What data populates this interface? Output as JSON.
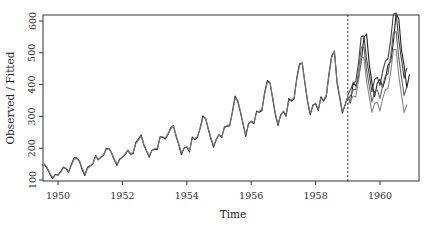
{
  "chart_data": {
    "type": "line",
    "title": "",
    "xlabel": "Time",
    "ylabel": "Observed / Fitted",
    "xlim": [
      1949.53,
      1961.2
    ],
    "ylim": [
      90,
      625
    ],
    "x_ticks": [
      1950,
      1952,
      1954,
      1956,
      1958,
      1960
    ],
    "x_tick_labels": [
      "1950",
      "1952",
      "1954",
      "1956",
      "1958",
      "1960"
    ],
    "y_ticks": [
      100,
      200,
      300,
      400,
      500,
      600
    ],
    "y_tick_labels": [
      "100",
      "200",
      "300",
      "400",
      "500",
      "600"
    ],
    "grid": false,
    "legend": null,
    "vline": {
      "x": 1959.0,
      "style": "dotted"
    },
    "series": [
      {
        "name": "Observed",
        "color": "#222222",
        "start": 1949.5,
        "step": 0.08333,
        "values": [
          148,
          148,
          136,
          119,
          104,
          118,
          115,
          126,
          141,
          135,
          125,
          149,
          170,
          170,
          158,
          133,
          114,
          140,
          145,
          150,
          178,
          163,
          172,
          178,
          199,
          199,
          184,
          162,
          146,
          166,
          171,
          180,
          193,
          181,
          183,
          218,
          230,
          242,
          209,
          191,
          172,
          194,
          196,
          196,
          236,
          235,
          229,
          243,
          264,
          272,
          237,
          211,
          180,
          201,
          204,
          188,
          235,
          227,
          234,
          264,
          302,
          293,
          259,
          229,
          203,
          229,
          242,
          233,
          267,
          269,
          270,
          315,
          364,
          347,
          312,
          274,
          237,
          278,
          284,
          277,
          317,
          313,
          318,
          374,
          413,
          405,
          355,
          306,
          271,
          306,
          315,
          301,
          356,
          348,
          355,
          422,
          465,
          467,
          404,
          347,
          305,
          336,
          340,
          318,
          362,
          348,
          363,
          435,
          491,
          505,
          404,
          359,
          310,
          337,
          360,
          342,
          406,
          396,
          420,
          472,
          548,
          559,
          463,
          407,
          362,
          405,
          417,
          391,
          419,
          461,
          472,
          535,
          622,
          606,
          508,
          461,
          390,
          432
        ]
      },
      {
        "name": "Fitted",
        "color": "#777777",
        "start": 1949.5,
        "step": 0.08333,
        "values": [
          148,
          150,
          138,
          122,
          108,
          116,
          117,
          124,
          139,
          137,
          128,
          146,
          165,
          168,
          160,
          138,
          118,
          136,
          144,
          152,
          174,
          166,
          170,
          180,
          196,
          198,
          186,
          165,
          150,
          163,
          172,
          182,
          194,
          184,
          186,
          214,
          226,
          238,
          212,
          193,
          176,
          192,
          198,
          200,
          232,
          236,
          232,
          245,
          260,
          270,
          240,
          215,
          185,
          198,
          206,
          192,
          230,
          230,
          237,
          262,
          297,
          295,
          262,
          233,
          208,
          226,
          243,
          236,
          263,
          272,
          274,
          311,
          358,
          350,
          316,
          278,
          241,
          275,
          286,
          280,
          313,
          316,
          322,
          370,
          408,
          408,
          360,
          311,
          276,
          303,
          317,
          305,
          350,
          352,
          359,
          416,
          460,
          470,
          408,
          352,
          310,
          332,
          342,
          322,
          358,
          352,
          367,
          430,
          486,
          506,
          410,
          364,
          315,
          334,
          362,
          345
        ]
      },
      {
        "name": "Forecast upper",
        "color": "#444444",
        "start": 1959.0,
        "step": 0.08333,
        "values": [
          367,
          384,
          405,
          410,
          468,
          551,
          553,
          480,
          430,
          378,
          416,
          423,
          398,
          442,
          474,
          482,
          541,
          621,
          625,
          540,
          478,
          420,
          452
        ]
      },
      {
        "name": "Forecast mean",
        "color": "#666666",
        "start": 1959.0,
        "step": 0.08333,
        "values": [
          352,
          366,
          384,
          385,
          440,
          518,
          518,
          445,
          395,
          345,
          378,
          383,
          357,
          398,
          428,
          434,
          489,
          564,
          566,
          483,
          422,
          365,
          393
        ]
      },
      {
        "name": "Forecast lower",
        "color": "#888888",
        "start": 1959.0,
        "step": 0.08333,
        "values": [
          338,
          348,
          364,
          361,
          413,
          486,
          484,
          411,
          361,
          313,
          341,
          344,
          317,
          356,
          384,
          388,
          439,
          510,
          510,
          428,
          368,
          312,
          338
        ]
      }
    ]
  }
}
